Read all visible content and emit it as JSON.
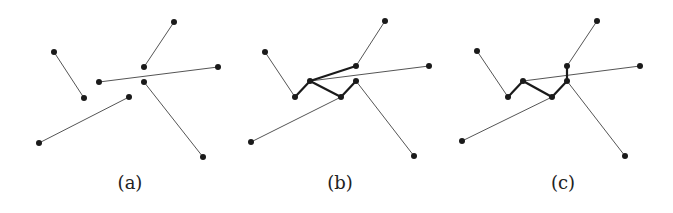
{
  "figure": {
    "panels": [
      {
        "id": "a",
        "caption": "(a)",
        "caption_x": 130,
        "points": [
          [
            54,
            52
          ],
          [
            84,
            98
          ],
          [
            99,
            82
          ],
          [
            218,
            67
          ],
          [
            144,
            67
          ],
          [
            174,
            22
          ],
          [
            144,
            82
          ],
          [
            203,
            157
          ],
          [
            129,
            97
          ],
          [
            39,
            143
          ]
        ],
        "thin_edges": [
          [
            0,
            1
          ],
          [
            2,
            3
          ],
          [
            4,
            5
          ],
          [
            6,
            7
          ],
          [
            8,
            9
          ]
        ],
        "bold_edges": []
      },
      {
        "id": "b",
        "caption": "(b)",
        "caption_x": 340,
        "points": [
          [
            265,
            52
          ],
          [
            295,
            97
          ],
          [
            310,
            81
          ],
          [
            429,
            66
          ],
          [
            356,
            66
          ],
          [
            385,
            21
          ],
          [
            356,
            81
          ],
          [
            414,
            156
          ],
          [
            341,
            97
          ],
          [
            251,
            142
          ]
        ],
        "thin_edges": [
          [
            0,
            1
          ],
          [
            2,
            3
          ],
          [
            4,
            5
          ],
          [
            6,
            7
          ],
          [
            8,
            9
          ]
        ],
        "bold_edges": [
          [
            1,
            2
          ],
          [
            2,
            4
          ],
          [
            2,
            8
          ],
          [
            8,
            6
          ]
        ]
      },
      {
        "id": "c",
        "caption": "(c)",
        "caption_x": 563,
        "points": [
          [
            477,
            51
          ],
          [
            508,
            97
          ],
          [
            523,
            81
          ],
          [
            640,
            66
          ],
          [
            567,
            66
          ],
          [
            597,
            21
          ],
          [
            567,
            81
          ],
          [
            625,
            156
          ],
          [
            552,
            97
          ],
          [
            462,
            141
          ]
        ],
        "thin_edges": [
          [
            0,
            1
          ],
          [
            2,
            3
          ],
          [
            4,
            5
          ],
          [
            6,
            7
          ],
          [
            8,
            9
          ]
        ],
        "bold_edges": [
          [
            1,
            2
          ],
          [
            2,
            8
          ],
          [
            8,
            6
          ],
          [
            6,
            4
          ]
        ]
      }
    ],
    "colors": {
      "thin_edge": "#555555",
      "bold_edge": "#1a1a1a",
      "point": "#1a1a1a"
    },
    "point_radius": 3
  }
}
